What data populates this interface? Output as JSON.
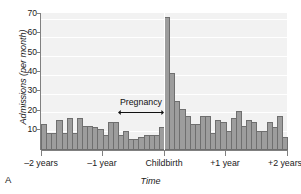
{
  "panel": {
    "letter": "A"
  },
  "chart_data": {
    "type": "bar",
    "title": "",
    "xlabel": "Time",
    "ylabel": "Admissions (per month)",
    "ylim": [
      0,
      73
    ],
    "yticks": [
      10,
      20,
      30,
      40,
      50,
      60,
      70
    ],
    "grid": true,
    "legend": null,
    "xtick_labels": [
      "–2 years",
      "–1 year",
      "Childbirth",
      "+1 year",
      "+2 years"
    ],
    "xtick_months": [
      -24,
      -12,
      0,
      12,
      24
    ],
    "x_unit": "months relative to childbirth",
    "annotations": [
      {
        "text": "Pregnancy",
        "type": "double-arrow-span",
        "from_month": -9,
        "to_month": 0
      },
      {
        "text": "",
        "type": "vertical-line",
        "at_month": 0
      }
    ],
    "categories": [
      -24,
      -23,
      -22,
      -21,
      -20,
      -19,
      -18,
      -17,
      -16,
      -15,
      -14,
      -13,
      -12,
      -11,
      -10,
      -9,
      -8,
      -7,
      -6,
      -5,
      -4,
      -3,
      -2,
      -1,
      0,
      1,
      2,
      3,
      4,
      5,
      6,
      7,
      8,
      9,
      10,
      11,
      12,
      13,
      14,
      15,
      16,
      17,
      18,
      19,
      20,
      21,
      22,
      23
    ],
    "values": [
      14,
      9,
      9,
      16,
      9,
      17,
      9,
      17,
      13,
      13,
      12,
      11,
      8,
      15,
      15,
      8,
      10,
      6,
      6,
      7,
      8,
      8,
      8,
      12,
      71,
      41,
      26,
      22,
      18,
      14,
      14,
      18,
      18,
      9,
      16,
      15,
      10,
      17,
      21,
      13,
      16,
      15,
      10,
      10,
      15,
      12,
      18,
      7
    ]
  }
}
